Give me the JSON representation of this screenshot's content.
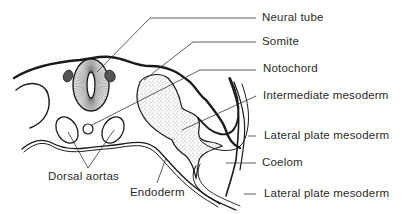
{
  "diagram": {
    "labels": {
      "neural_tube": "Neural tube",
      "somite": "Somite",
      "notochord": "Notochord",
      "intermediate_mesoderm": "Intermediate mesoderm",
      "lateral_plate_mesoderm_upper": "Lateral plate mesoderm",
      "coelom": "Coelom",
      "lateral_plate_mesoderm_lower": "Lateral plate mesoderm",
      "dorsal_aortas": "Dorsal aortas",
      "endoderm": "Endoderm"
    }
  }
}
